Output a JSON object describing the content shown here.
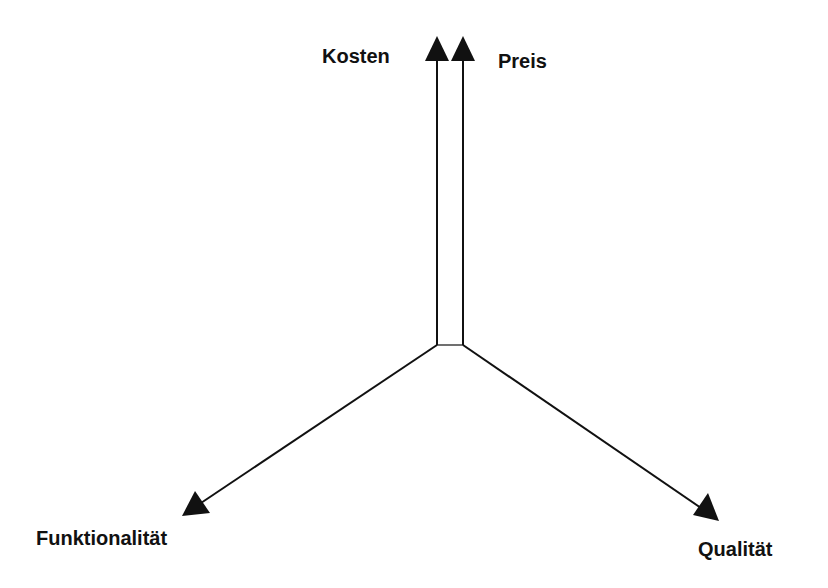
{
  "diagram": {
    "type": "three-axis magic triangle",
    "axes": [
      {
        "id": "kosten",
        "label": "Kosten",
        "direction": "up"
      },
      {
        "id": "preis",
        "label": "Preis",
        "direction": "up"
      },
      {
        "id": "funktionalitaet",
        "label": "Funktionalität",
        "direction": "down-left"
      },
      {
        "id": "qualitaet",
        "label": "Qualität",
        "direction": "down-right"
      }
    ],
    "colors": {
      "line": "#111111",
      "background": "#ffffff"
    }
  }
}
